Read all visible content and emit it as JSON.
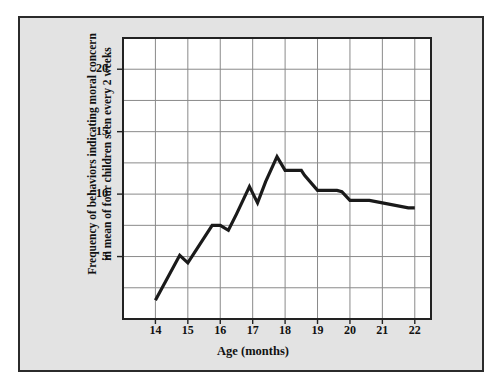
{
  "figure": {
    "background_color": "#e3e3e3",
    "page_color": "#ffffff",
    "frame_color": "#2b2b2b"
  },
  "chart_data": {
    "type": "line",
    "title": "",
    "subtitle": "",
    "xlabel": "Age (months)",
    "ylabel": "Frequency of behaviors indicating moral concern in mean of four children seen every 2 weeks",
    "ylabel_line1": "Frequency of behaviors indicating moral concern",
    "ylabel_line2": "in mean of four children seen every 2 weeks",
    "xlim": [
      13.0,
      22.5
    ],
    "ylim": [
      0.0,
      22.5
    ],
    "xticks": [
      14,
      15,
      16,
      17,
      18,
      19,
      20,
      21,
      22
    ],
    "xtick_labels": [
      "14",
      "15",
      "16",
      "17",
      "18",
      "19",
      "20",
      "21",
      "22"
    ],
    "yticks": [
      5,
      10,
      15,
      20
    ],
    "ytick_labels": [
      "5",
      "10",
      "15",
      "20"
    ],
    "y_gridlines": [
      2.5,
      5,
      7.5,
      10,
      12.5,
      15,
      17.5,
      20
    ],
    "x_gridlines": [
      14,
      15,
      16,
      17,
      18,
      19,
      20,
      21,
      22
    ],
    "grid": true,
    "grid_color": "#8a8a8a",
    "legend": null,
    "legend_position": "none",
    "line_color": "#1a1a1a",
    "line_width": 3.2,
    "plot_background": "#ffffff",
    "series": [
      {
        "name": "Moral concern behaviors",
        "x": [
          14.0,
          14.75,
          15.0,
          15.75,
          16.0,
          16.25,
          16.5,
          16.9,
          17.15,
          17.4,
          17.75,
          18.0,
          18.5,
          18.6,
          19.0,
          19.6,
          19.75,
          20.0,
          20.6,
          21.0,
          21.8,
          22.0
        ],
        "values": [
          1.5,
          5.1,
          4.5,
          7.5,
          7.5,
          7.1,
          8.4,
          10.6,
          9.3,
          11.0,
          13.0,
          11.9,
          11.9,
          11.5,
          10.3,
          10.3,
          10.2,
          9.5,
          9.5,
          9.3,
          8.9,
          8.9
        ]
      }
    ]
  }
}
